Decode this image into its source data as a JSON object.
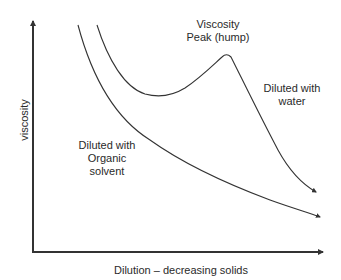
{
  "diagram": {
    "type": "viscosity-vs-dilution",
    "axes": {
      "x_label": "Dilution – decreasing solids",
      "y_label": "viscosity"
    },
    "annotations": {
      "peak": [
        "Viscosity",
        "Peak (hump)"
      ],
      "water": [
        "Diluted with",
        "water"
      ],
      "organic": [
        "Diluted with",
        "Organic",
        "solvent"
      ]
    },
    "curves": [
      {
        "name": "Diluted with water",
        "shape": "decrease, minimum, hump peak, steep decrease",
        "color": "#333333"
      },
      {
        "name": "Diluted with Organic solvent",
        "shape": "monotonic decreasing",
        "color": "#333333"
      }
    ],
    "colors": {
      "axis": "#333333",
      "curve": "#333333",
      "text": "#2a2a2a",
      "background": "#ffffff"
    }
  }
}
